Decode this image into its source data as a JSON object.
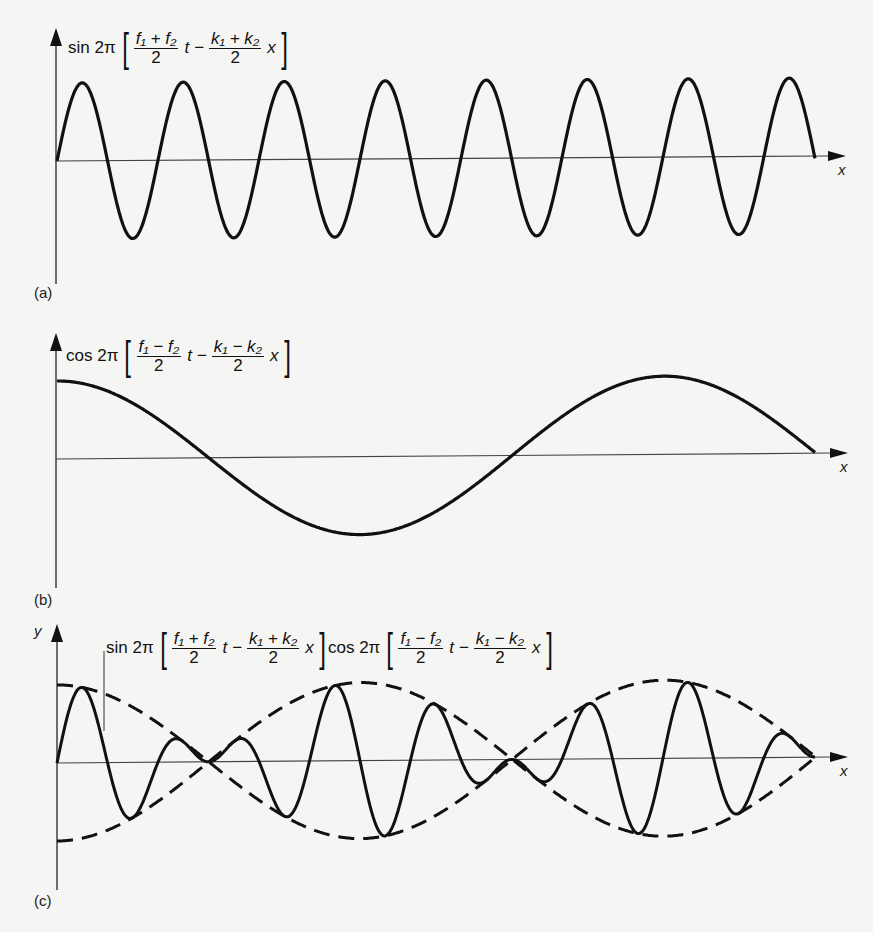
{
  "panels": [
    {
      "id": "a",
      "label": "(a)",
      "formula": {
        "func": "sin 2π",
        "open": "[",
        "close": "]",
        "term1_num": "f₁ + f₂",
        "term1_den": "2",
        "term1_var": "t",
        "op": "−",
        "term2_num": "k₁ + k₂",
        "term2_den": "2",
        "term2_var": "x"
      },
      "x_axis_label": "x"
    },
    {
      "id": "b",
      "label": "(b)",
      "formula": {
        "func": "cos 2π",
        "open": "[",
        "close": "]",
        "term1_num": "f₁ − f₂",
        "term1_den": "2",
        "term1_var": "t",
        "op": "−",
        "term2_num": "k₁ − k₂",
        "term2_den": "2",
        "term2_var": "x"
      },
      "x_axis_label": "x"
    },
    {
      "id": "c",
      "label": "(c)",
      "y_axis_label": "y",
      "formula_sin": {
        "func": "sin 2π",
        "open": "[",
        "close": "]",
        "term1_num": "f₁ + f₂",
        "term1_den": "2",
        "term1_var": "t",
        "op": "−",
        "term2_num": "k₁ + k₂",
        "term2_den": "2",
        "term2_var": "x"
      },
      "formula_cos": {
        "func": "cos 2π",
        "open": "[",
        "close": "]",
        "term1_num": "f₁ − f₂",
        "term1_den": "2",
        "term1_var": "t",
        "op": "−",
        "term2_num": "k₁ − k₂",
        "term2_den": "2",
        "term2_var": "x"
      },
      "x_axis_label": "x"
    }
  ],
  "waves": {
    "carrier_period_px": 101,
    "envelope_period_px": 607,
    "amplitude_px": 78,
    "x_start": 57,
    "x_end": 815,
    "line_color": "#111111"
  }
}
